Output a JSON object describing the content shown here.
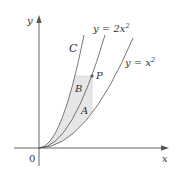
{
  "figure": {
    "axes": {
      "x_label": "x",
      "y_label": "y",
      "origin_label": "0"
    },
    "curves": [
      {
        "name": "C",
        "label": "C",
        "equation": "y = kx^2 (k≈4.35)"
      },
      {
        "name": "y=2x^2",
        "label_prefix": "y = 2x",
        "label_sup": "2"
      },
      {
        "name": "y=x^2",
        "label_prefix": "y = x",
        "label_sup": "2"
      }
    ],
    "point": {
      "label": "P"
    },
    "regions": [
      {
        "label": "A"
      },
      {
        "label": "B"
      }
    ],
    "colors": {
      "curve": "#555555",
      "axis": "#555555",
      "shade": "#e6e6e6",
      "point": "#555555"
    }
  }
}
